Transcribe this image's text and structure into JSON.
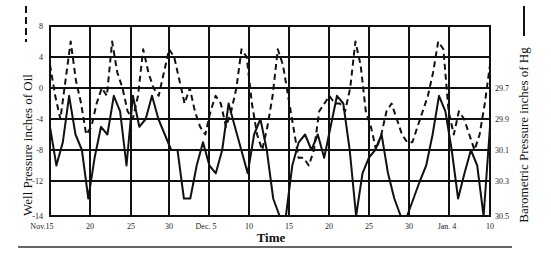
{
  "chart_data": {
    "type": "line",
    "title": "",
    "xlabel": "Time",
    "ylabel_left": "Well Pressure inches of Oil",
    "ylabel_right": "Barometric Pressure inches of Hg",
    "x_tick_labels": [
      "Nov.15",
      "20",
      "25",
      "30",
      "Dec. 5",
      "10",
      "15",
      "20",
      "25",
      "30",
      "Jan. 4",
      "10"
    ],
    "left_axis": {
      "ticks": [
        8,
        4,
        0,
        -4,
        -8,
        -12,
        -14
      ],
      "ylim": [
        -14,
        8
      ]
    },
    "right_axis": {
      "ticks": [
        "29.7",
        "29.9",
        "30.1",
        "30.3",
        "30.5"
      ],
      "inverted": true,
      "ylim": [
        29.5,
        30.5
      ]
    },
    "grid": true,
    "legend": {
      "left_marker": "dashed",
      "right_marker": "solid"
    },
    "series": [
      {
        "name": "Well Pressure (inches of Oil)",
        "style": "dashed",
        "axis": "left",
        "days_from_nov15": [
          0,
          1,
          2,
          3,
          4,
          5,
          5.5,
          6,
          7,
          8,
          9,
          10,
          11,
          11.5,
          12,
          13,
          13.5,
          14,
          15,
          15.5,
          16,
          17,
          18,
          19,
          20,
          21,
          22,
          23,
          24,
          25,
          26,
          27,
          27.5,
          28,
          29,
          30,
          31,
          32,
          33,
          34,
          35,
          36,
          37,
          38,
          39,
          40,
          41,
          42,
          43,
          44,
          45,
          46,
          47,
          48,
          49,
          50,
          51,
          52,
          53,
          54,
          55,
          56,
          57,
          58,
          59,
          60,
          61,
          62,
          63,
          64,
          65,
          66,
          67,
          68,
          69,
          70
        ],
        "values": [
          3,
          -1,
          -4,
          1,
          6,
          1,
          -2,
          -6,
          -5,
          -2,
          0,
          -1,
          6,
          2,
          0,
          -3,
          -4,
          -1,
          5,
          2,
          0,
          -1,
          2,
          5,
          4,
          1,
          -2,
          0,
          -3,
          -5,
          -6,
          -3,
          -1,
          -2,
          -5,
          -3,
          0,
          5,
          4,
          -2,
          -6,
          -8,
          -5,
          -1,
          5,
          3,
          -1,
          -5,
          -9,
          -9,
          -10,
          -8,
          -3,
          -2,
          -1,
          -2,
          -2,
          -3,
          0,
          6,
          3,
          -3,
          -5,
          -8,
          -6,
          -3,
          -2,
          -4,
          -6,
          -7,
          -7,
          -5,
          -3,
          -1,
          2,
          6,
          5,
          -3,
          -6,
          -3,
          -4,
          -6,
          -8,
          -6,
          -2,
          3
        ],
        "note": "approximate values read off gridlines"
      },
      {
        "name": "Barometric Pressure (inches of Hg)",
        "style": "solid",
        "axis": "right",
        "days_from_nov15": [
          0,
          2,
          3,
          4,
          5,
          6,
          7,
          8,
          9,
          10,
          11,
          12,
          13,
          14,
          15,
          16,
          17,
          18,
          19,
          20,
          21,
          22,
          23,
          24,
          25,
          26,
          27,
          28,
          29,
          30,
          31,
          32,
          33,
          34,
          35,
          36,
          37,
          38,
          39,
          40,
          41,
          42,
          43,
          44,
          45,
          46,
          47,
          48,
          49,
          50,
          51,
          52,
          53,
          54,
          55,
          56,
          57,
          58,
          59,
          60,
          61,
          62,
          63,
          64,
          65,
          66,
          67,
          68,
          69,
          70
        ],
        "values_left_scale": [
          -5,
          -10,
          -7,
          -1,
          -6,
          -8,
          -13,
          -9,
          -5,
          -6,
          -1,
          -3,
          -10,
          -1,
          -5,
          -4,
          -1,
          -4,
          -6,
          -8,
          -8,
          -13,
          -13,
          -10,
          -7,
          -10,
          -11,
          -8,
          -2,
          -5,
          -8,
          -11,
          -6,
          -4,
          -8,
          -13,
          -14,
          -14,
          -10,
          -7,
          -6,
          -8,
          -6,
          -9,
          -5,
          -1,
          -2,
          -8,
          -14,
          -11,
          -9,
          -8,
          -6,
          -11,
          -13,
          -14,
          -14,
          -13,
          -12,
          -10,
          -6,
          -1,
          -3,
          -8,
          -13,
          -11,
          -8,
          -10,
          -14,
          -5
        ]
      }
    ]
  },
  "labels": {
    "left_title": "Well Pressure  inches of Oil",
    "right_title": "Barometric Pressure  inches of Hg",
    "x_title": "Time",
    "left_ticks": [
      "8",
      "4",
      "0",
      "-4",
      "-8",
      "-12",
      "-14"
    ],
    "right_ticks": [
      "29.7",
      "29.9",
      "30.1",
      "30.3",
      "30.5"
    ],
    "x_ticks": [
      "Nov.15",
      "20",
      "25",
      "30",
      "Dec. 5",
      "10",
      "15",
      "20",
      "25",
      "30",
      "Jan. 4",
      "10"
    ]
  }
}
